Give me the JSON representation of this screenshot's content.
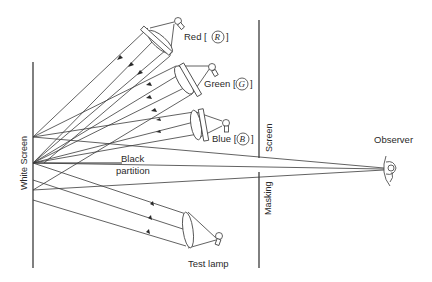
{
  "diagram": {
    "labels": {
      "red": "Red [",
      "red_symbol": "R",
      "red_close": "]",
      "green": "Green [",
      "green_symbol": "G",
      "green_close": "]",
      "blue": "Blue [",
      "blue_symbol": "B",
      "blue_close": "]",
      "white_screen": "White Screen",
      "black_partition_1": "Black",
      "black_partition_2": "partition",
      "screen": "Screen",
      "masking": "Masking",
      "observer": "Observer",
      "test_lamp": "Test lamp"
    },
    "colors": {
      "line": "#3a3a3a",
      "background": "#ffffff"
    }
  }
}
